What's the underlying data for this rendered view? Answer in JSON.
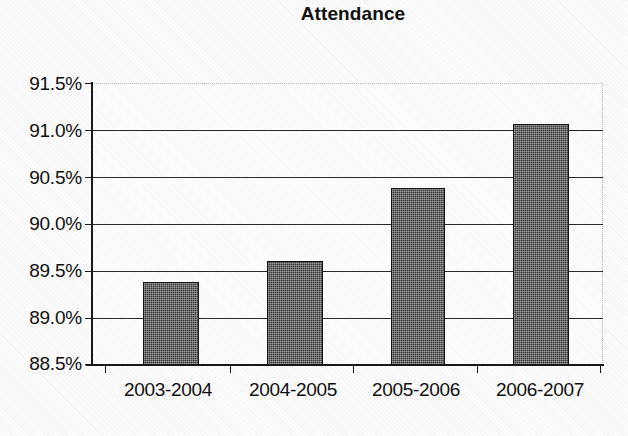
{
  "chart_data": {
    "type": "bar",
    "title": "Attendance",
    "xlabel": "",
    "ylabel": "",
    "categories": [
      "2003-2004",
      "2004-2005",
      "2005-2006",
      "2006-2007"
    ],
    "values": [
      89.38,
      89.61,
      90.38,
      91.06
    ],
    "value_labels": [
      "89.38%",
      "89.61%",
      "90.38%",
      "91.06%"
    ],
    "ylim": [
      88.5,
      91.5
    ],
    "ytick_values": [
      91.5,
      91.0,
      90.5,
      90.0,
      89.5,
      89.0,
      88.5
    ],
    "ytick_labels": [
      "91.5%",
      "91.0%",
      "90.5%",
      "90.0%",
      "89.5%",
      "89.0%",
      "88.5%"
    ],
    "grid": "horizontal",
    "legend": "none",
    "series": [
      {
        "name": "Attendance",
        "values": [
          89.38,
          89.61,
          90.38,
          91.06
        ],
        "color": "#3a3a3a"
      }
    ]
  },
  "colors": {
    "bar_fill": "#3a3a3a",
    "bar_outline": "#141414",
    "gridline": "#2a2a2a",
    "axis": "#1a1a1a",
    "text": "#101010",
    "background": "#fdfdfd"
  }
}
